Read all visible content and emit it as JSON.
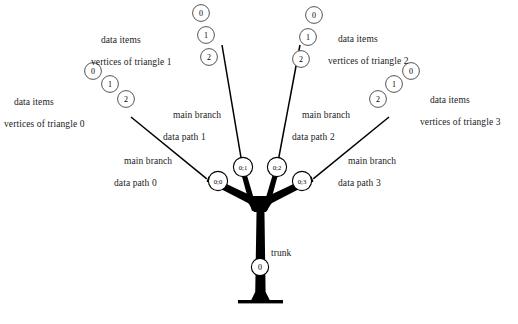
{
  "figure": {
    "background_color": "#ffffff",
    "ink_color": "#000000"
  },
  "trunk": {
    "label": "trunk",
    "node_label": "0"
  },
  "branches": [
    {
      "id": "branch-0",
      "node_label": "0;0",
      "caption_line1": "main branch",
      "caption_line2": "data path 0",
      "triangle_caption_line1": "data items",
      "triangle_caption_line2": "vertices of triangle 0",
      "vertices": [
        "0",
        "1",
        "2"
      ]
    },
    {
      "id": "branch-1",
      "node_label": "0;1",
      "caption_line1": "main branch",
      "caption_line2": "data path 1",
      "triangle_caption_line1": "data items",
      "triangle_caption_line2": "vertices of triangle 1",
      "vertices": [
        "0",
        "1",
        "2"
      ]
    },
    {
      "id": "branch-2",
      "node_label": "0;2",
      "caption_line1": "main branch",
      "caption_line2": "data path 2",
      "triangle_caption_line1": "data items",
      "triangle_caption_line2": "vertices of triangle 2",
      "vertices": [
        "0",
        "1",
        "2"
      ]
    },
    {
      "id": "branch-3",
      "node_label": "0;3",
      "caption_line1": "main branch",
      "caption_line2": "data path 3",
      "triangle_caption_line1": "data items",
      "triangle_caption_line2": "vertices of triangle 3",
      "vertices": [
        "0",
        "1",
        "2"
      ]
    }
  ],
  "bottom_caption": "Figure 1: tree structure"
}
